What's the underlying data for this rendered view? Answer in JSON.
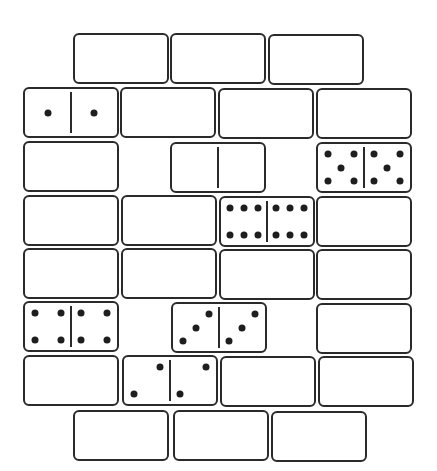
{
  "puzzle": {
    "type": "domino-grid",
    "colors": {
      "outline": "#2a2a2a",
      "pip": "#1e1e1e",
      "background": "#ffffff"
    },
    "domino_size": {
      "width": 94,
      "height": 49
    },
    "dominoes": [
      {
        "id": "r1c1",
        "x": 73,
        "y": 33,
        "blank": true
      },
      {
        "id": "r1c2",
        "x": 170,
        "y": 33,
        "blank": true
      },
      {
        "id": "r1c3",
        "x": 268,
        "y": 34,
        "blank": true
      },
      {
        "id": "r2c1",
        "x": 23,
        "y": 87,
        "blank": false,
        "left": 1,
        "right": 1
      },
      {
        "id": "r2c2",
        "x": 120,
        "y": 87,
        "blank": true
      },
      {
        "id": "r2c3",
        "x": 218,
        "y": 88,
        "blank": true
      },
      {
        "id": "r2c4",
        "x": 316,
        "y": 88,
        "blank": true
      },
      {
        "id": "r3c1",
        "x": 23,
        "y": 141,
        "blank": true
      },
      {
        "id": "r3c2",
        "x": 170,
        "y": 142,
        "blank": false,
        "left": 0,
        "right": 0
      },
      {
        "id": "r3c3",
        "x": 316,
        "y": 142,
        "blank": false,
        "left": 5,
        "right": 5
      },
      {
        "id": "r4c1",
        "x": 23,
        "y": 195,
        "blank": true
      },
      {
        "id": "r4c2",
        "x": 121,
        "y": 195,
        "blank": true
      },
      {
        "id": "r4c3",
        "x": 219,
        "y": 196,
        "blank": false,
        "left": 6,
        "right": 6
      },
      {
        "id": "r4c4",
        "x": 316,
        "y": 196,
        "blank": true
      },
      {
        "id": "r5c1",
        "x": 23,
        "y": 248,
        "blank": true
      },
      {
        "id": "r5c2",
        "x": 121,
        "y": 248,
        "blank": true
      },
      {
        "id": "r5c3",
        "x": 219,
        "y": 249,
        "blank": true
      },
      {
        "id": "r5c4",
        "x": 316,
        "y": 249,
        "blank": true
      },
      {
        "id": "r6c1",
        "x": 23,
        "y": 301,
        "blank": false,
        "left": 4,
        "right": 4
      },
      {
        "id": "r6c2",
        "x": 171,
        "y": 302,
        "blank": false,
        "left": 3,
        "right": 3
      },
      {
        "id": "r6c3",
        "x": 316,
        "y": 303,
        "blank": true
      },
      {
        "id": "r7c1",
        "x": 23,
        "y": 355,
        "blank": true
      },
      {
        "id": "r7c2",
        "x": 122,
        "y": 355,
        "blank": false,
        "left": 2,
        "right": 2
      },
      {
        "id": "r7c3",
        "x": 220,
        "y": 356,
        "blank": true
      },
      {
        "id": "r7c4",
        "x": 318,
        "y": 356,
        "blank": true
      },
      {
        "id": "r8c1",
        "x": 73,
        "y": 410,
        "blank": true
      },
      {
        "id": "r8c2",
        "x": 173,
        "y": 410,
        "blank": true
      },
      {
        "id": "r8c3",
        "x": 271,
        "y": 411,
        "blank": true
      }
    ]
  }
}
